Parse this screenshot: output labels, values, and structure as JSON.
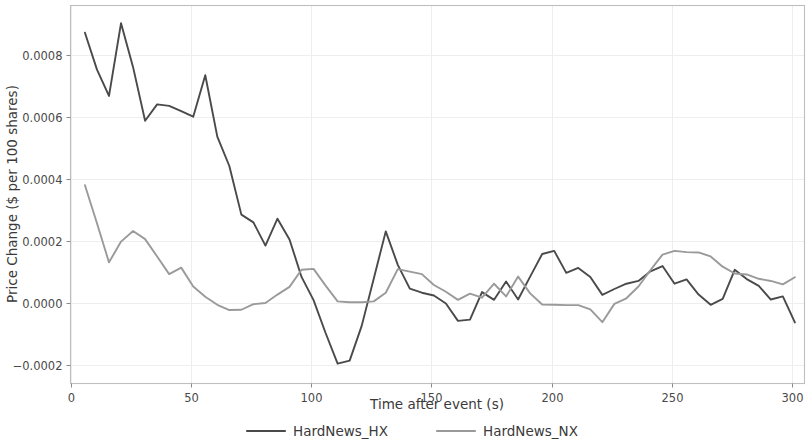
{
  "chart_data": {
    "type": "line",
    "title": "",
    "xlabel": "Time after event (s)",
    "ylabel": "Price Change ($ per 100 shares)",
    "xlim": [
      0,
      305
    ],
    "ylim": [
      -0.00026,
      0.00096
    ],
    "xticks": [
      0,
      50,
      100,
      150,
      200,
      250,
      300
    ],
    "xticklabels": [
      "0",
      "50",
      "100",
      "150",
      "200",
      "250",
      "300"
    ],
    "yticks": [
      -0.0002,
      0.0,
      0.0002,
      0.0004,
      0.0006,
      0.0008
    ],
    "yticklabels": [
      "−0.0002",
      "0.0000",
      "0.0002",
      "0.0004",
      "0.0006",
      "0.0008"
    ],
    "grid": true,
    "legend_position": "below-axes",
    "series": [
      {
        "name": "HardNews_HX",
        "color": "#4a4a4a",
        "x": [
          6,
          11,
          16,
          21,
          26,
          31,
          36,
          41,
          46,
          51,
          56,
          61,
          66,
          71,
          76,
          81,
          86,
          91,
          96,
          101,
          106,
          111,
          116,
          121,
          126,
          131,
          136,
          141,
          146,
          151,
          156,
          161,
          166,
          171,
          176,
          181,
          186,
          191,
          196,
          201,
          206,
          211,
          216,
          221,
          226,
          231,
          236,
          241,
          246,
          251,
          256,
          261,
          266,
          271,
          276,
          281,
          286,
          291,
          296,
          301
        ],
        "y": [
          0.000872,
          0.000753,
          0.000668,
          0.000903,
          0.000761,
          0.000588,
          0.000641,
          0.000636,
          0.000619,
          0.000601,
          0.000735,
          0.000537,
          0.000442,
          0.000285,
          0.00026,
          0.000185,
          0.000272,
          0.000205,
          8.4e-05,
          9e-06,
          -9.7e-05,
          -0.000196,
          -0.000186,
          -7.4e-05,
          7.8e-05,
          0.000231,
          0.000123,
          4.6e-05,
          3.3e-05,
          2.4e-05,
          -2e-06,
          -5.8e-05,
          -5.4e-05,
          3.5e-05,
          1e-05,
          6.9e-05,
          1.1e-05,
          8.5e-05,
          0.000158,
          0.000168,
          9.7e-05,
          0.000113,
          8.4e-05,
          2.6e-05,
          4.5e-05,
          6.2e-05,
          7.1e-05,
          0.000102,
          0.000119,
          6.2e-05,
          7.6e-05,
          2.7e-05,
          -6e-06,
          1.3e-05,
          0.000107,
          7.7e-05,
          5.5e-05,
          1.1e-05,
          2.1e-05,
          -6.3e-05
        ]
      },
      {
        "name": "HardNews_NX",
        "color": "#9a9a9a",
        "x": [
          6,
          11,
          16,
          21,
          26,
          31,
          36,
          41,
          46,
          51,
          56,
          61,
          66,
          71,
          76,
          81,
          86,
          91,
          96,
          101,
          106,
          111,
          116,
          121,
          126,
          131,
          136,
          141,
          146,
          151,
          156,
          161,
          166,
          171,
          176,
          181,
          186,
          191,
          196,
          201,
          206,
          211,
          216,
          221,
          226,
          231,
          236,
          241,
          246,
          251,
          256,
          261,
          266,
          271,
          276,
          281,
          286,
          291,
          296,
          301
        ],
        "y": [
          0.00038,
          0.000257,
          0.000131,
          0.000198,
          0.000232,
          0.000206,
          0.00015,
          9.3e-05,
          0.000114,
          5.3e-05,
          2e-05,
          -6e-06,
          -2.3e-05,
          -2.2e-05,
          -4e-06,
          -0.0,
          2.7e-05,
          5.2e-05,
          0.000107,
          0.00011,
          5.6e-05,
          5e-06,
          2e-06,
          2e-06,
          5e-06,
          3.3e-05,
          0.000109,
          0.000101,
          9.3e-05,
          5.8e-05,
          3.6e-05,
          1e-05,
          3e-05,
          1.7e-05,
          6.2e-05,
          2.1e-05,
          8.5e-05,
          3.1e-05,
          -5e-06,
          -6e-06,
          -7e-06,
          -7e-06,
          -2.1e-05,
          -6.2e-05,
          -3e-06,
          1.5e-05,
          5.3e-05,
          0.000106,
          0.000156,
          0.000168,
          0.000164,
          0.000163,
          0.00015,
          0.000117,
          9.5e-05,
          9.2e-05,
          7.8e-05,
          7.1e-05,
          6e-05,
          8.3e-05
        ]
      }
    ]
  },
  "legend": {
    "entries": [
      {
        "label": "HardNews_HX",
        "color": "#4a4a4a"
      },
      {
        "label": "HardNews_NX",
        "color": "#9a9a9a"
      }
    ]
  },
  "axes": {
    "x_title": "Time after event (s)",
    "y_title": "Price Change ($ per 100 shares)"
  }
}
